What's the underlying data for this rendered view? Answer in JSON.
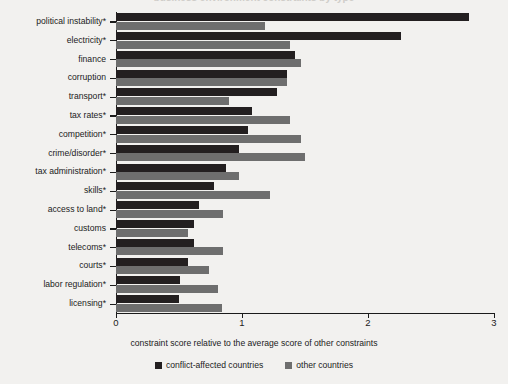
{
  "title_clipped": "business environment constraints by type",
  "axis": {
    "x_title": "constraint score relative to the average score of other constraints",
    "x_ticks": [
      "0",
      "1",
      "2",
      "3"
    ]
  },
  "legend": {
    "items": [
      {
        "label": "conflict-affected countries",
        "color": "#231f20",
        "key": "conflict"
      },
      {
        "label": "other countries",
        "color": "#6e6e6e",
        "key": "other"
      }
    ]
  },
  "chart_data": {
    "type": "bar",
    "orientation": "horizontal",
    "title": "",
    "xlabel": "constraint score relative to the average score of other constraints",
    "ylabel": "",
    "xlim": [
      0,
      3
    ],
    "xticks": [
      0,
      1,
      2,
      3
    ],
    "grid": false,
    "legend_position": "bottom-center",
    "categories": [
      "political instability*",
      "electricity*",
      "finance",
      "corruption",
      "transport*",
      "tax rates*",
      "competition*",
      "crime/disorder*",
      "tax administration*",
      "skills*",
      "access to land*",
      "customs",
      "telecoms*",
      "courts*",
      "labor regulation*",
      "licensing*"
    ],
    "series": [
      {
        "name": "conflict-affected countries",
        "color": "#231f20",
        "values": [
          2.8,
          2.26,
          1.42,
          1.36,
          1.28,
          1.08,
          1.05,
          0.98,
          0.87,
          0.78,
          0.66,
          0.62,
          0.62,
          0.57,
          0.51,
          0.5
        ]
      },
      {
        "name": "other countries",
        "color": "#6e6e6e",
        "values": [
          1.18,
          1.38,
          1.47,
          1.36,
          0.9,
          1.38,
          1.47,
          1.5,
          0.98,
          1.22,
          0.85,
          0.57,
          0.85,
          0.74,
          0.81,
          0.84
        ]
      }
    ]
  }
}
